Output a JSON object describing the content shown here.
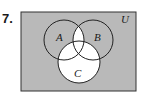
{
  "problem_number": "7.",
  "diagram": {
    "type": "venn",
    "universe_label": "U",
    "sets": [
      {
        "label": "A",
        "cx": 64,
        "cy": 40,
        "r": 20
      },
      {
        "label": "B",
        "cx": 93,
        "cy": 40,
        "r": 20
      },
      {
        "label": "C",
        "cx": 79,
        "cy": 62,
        "r": 21
      }
    ],
    "shaded_color": "#b9b9b9",
    "unshaded_color": "#ffffff",
    "unshaded_regions": "(A ∩ B) ∪ C"
  }
}
